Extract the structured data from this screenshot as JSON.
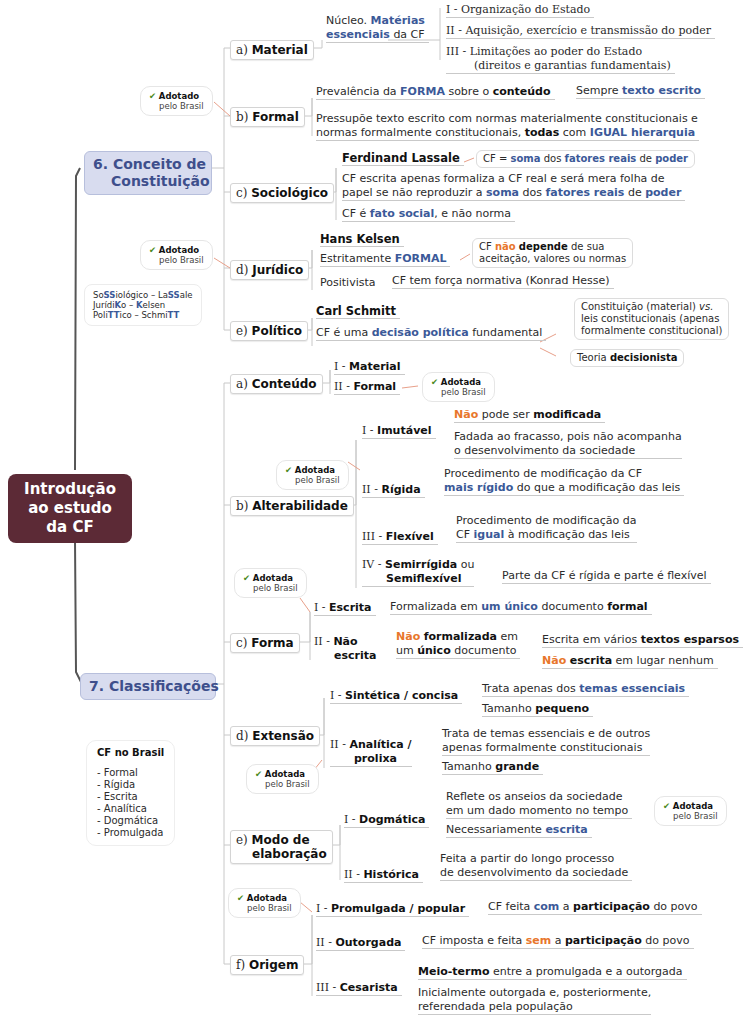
{
  "root": {
    "label_lines": [
      "Introdução",
      "ao estudo",
      "da CF"
    ]
  },
  "colors": {
    "root_bg": "#5c2a36",
    "topic_bg": "#d8dcef",
    "topic_text": "#3e4f8c",
    "emphasis_blue": "#3b5998",
    "emphasis_orange": "#e8762c",
    "check_green": "#4b8a22"
  },
  "topics": [
    {
      "id": "conceito",
      "label_lines": [
        "6. Conceito de",
        "Constituição"
      ]
    },
    {
      "id": "classificacoes",
      "label": "7. Classificações"
    }
  ],
  "adopted_note": {
    "check": "✔",
    "line1": "Adotado",
    "line2": "pelo Brasil"
  },
  "adopted_note_f": {
    "check": "✔",
    "line1": "Adotada",
    "line2": "pelo Brasil"
  },
  "conceito": {
    "material": {
      "label_prefix": "a) ",
      "label": "Material",
      "desc": [
        {
          "t": "Núcleo. "
        },
        {
          "t": "Matérias",
          "s": "bl"
        }
      ],
      "desc2": [
        {
          "t": "essenciais",
          "s": "bl"
        },
        {
          "t": " da CF"
        }
      ],
      "items": [
        "I - Organização do Estado",
        "II - Aquisição, exercício e transmissão do poder",
        "III - Limitações ao poder do Estado",
        "(direitos e garantias fundamentais)"
      ]
    },
    "formal": {
      "label_prefix": "b) ",
      "label": "Formal",
      "line1": [
        {
          "t": "Prevalência da "
        },
        {
          "t": "FORMA",
          "s": "bl"
        },
        {
          "t": " sobre o "
        },
        {
          "t": "conteúdo",
          "s": "b"
        }
      ],
      "line1_child": [
        {
          "t": "Sempre "
        },
        {
          "t": "texto escrito",
          "s": "bl"
        }
      ],
      "line2a": [
        {
          "t": "Pressupõe texto escrito com normas materialmente constitucionais e"
        }
      ],
      "line2b": [
        {
          "t": "normas formalmente constitucionais, "
        },
        {
          "t": "todas",
          "s": "b"
        },
        {
          "t": " com "
        },
        {
          "t": "IGUAL hierarquia",
          "s": "bl"
        }
      ]
    },
    "sociologico": {
      "label_prefix": "c) ",
      "label": "Sociológico",
      "author": "Ferdinand Lassale",
      "author_callout": [
        {
          "t": "CF = "
        },
        {
          "t": "soma",
          "s": "bl"
        },
        {
          "t": " dos "
        },
        {
          "t": "fatores reais",
          "s": "bl"
        },
        {
          "t": " de "
        },
        {
          "t": "poder",
          "s": "bl"
        }
      ],
      "line1a": [
        {
          "t": "CF escrita apenas formaliza a CF real e será mera folha de"
        }
      ],
      "line1b": [
        {
          "t": "papel se não reproduzir a "
        },
        {
          "t": "soma",
          "s": "bl"
        },
        {
          "t": " dos "
        },
        {
          "t": "fatores reais",
          "s": "bl"
        },
        {
          "t": " de "
        },
        {
          "t": "poder",
          "s": "bl"
        }
      ],
      "line2": [
        {
          "t": "CF é "
        },
        {
          "t": "fato social",
          "s": "bl"
        },
        {
          "t": ", e não norma"
        }
      ]
    },
    "juridico": {
      "label_prefix": "d) ",
      "label": "Jurídico",
      "author": "Hans Kelsen",
      "line1": [
        {
          "t": "Estritamente "
        },
        {
          "t": "FORMAL",
          "s": "bl"
        }
      ],
      "callout_a": [
        {
          "t": "CF "
        },
        {
          "t": "não",
          "s": "or"
        },
        {
          "t": " "
        },
        {
          "t": "depende",
          "s": "b"
        },
        {
          "t": " de sua"
        }
      ],
      "callout_b": [
        {
          "t": "aceitação, valores ou normas"
        }
      ],
      "line2": "Positivista",
      "line2_child": "CF tem força normativa (Konrad Hesse)"
    },
    "politico": {
      "label_prefix": "e) ",
      "label": "Político",
      "author": "Carl Schmitt",
      "line1": [
        {
          "t": "CF é uma "
        },
        {
          "t": "decisão política",
          "s": "bl"
        },
        {
          "t": " fundamental"
        }
      ],
      "callout1_a": [
        {
          "t": "Constituição (material) "
        },
        {
          "t": "vs.",
          "s": "it"
        }
      ],
      "callout1_b": [
        {
          "t": "leis constitucionais (apenas"
        }
      ],
      "callout1_c": [
        {
          "t": "formalmente constitucional)"
        }
      ],
      "callout2": [
        {
          "t": "Teoria "
        },
        {
          "t": "decisionista",
          "s": "b"
        }
      ]
    },
    "mnemonic": [
      [
        {
          "t": "So"
        },
        {
          "t": "SS",
          "s": "bl"
        },
        {
          "t": "iológico – La"
        },
        {
          "t": "SS",
          "s": "bl"
        },
        {
          "t": "ale"
        }
      ],
      [
        {
          "t": "Jurídi"
        },
        {
          "t": "K",
          "s": "bl"
        },
        {
          "t": "o – "
        },
        {
          "t": "K",
          "s": "bl"
        },
        {
          "t": "elsen"
        }
      ],
      [
        {
          "t": "Poli"
        },
        {
          "t": "TT",
          "s": "bl"
        },
        {
          "t": "ico – Schmi"
        },
        {
          "t": "TT",
          "s": "bl"
        }
      ]
    ]
  },
  "classificacoes": {
    "conteudo": {
      "label_prefix": "a) ",
      "label": "Conteúdo",
      "items": [
        {
          "num": "I - ",
          "label": "Material"
        },
        {
          "num": "II - ",
          "label": "Formal"
        }
      ]
    },
    "alterabilidade": {
      "label_prefix": "b) ",
      "label": "Alterabilidade",
      "items": [
        {
          "num": "I - ",
          "label": "Imutável",
          "desc1": [
            {
              "t": "Não",
              "s": "or"
            },
            {
              "t": " pode ser "
            },
            {
              "t": "modificada",
              "s": "b"
            }
          ],
          "desc2a": "Fadada ao fracasso, pois não acompanha",
          "desc2b": "o desenvolvimento da sociedade"
        },
        {
          "num": "II - ",
          "label": "Rígida",
          "desc_a": [
            {
              "t": "Procedimento de modificação da CF"
            }
          ],
          "desc_b": [
            {
              "t": "mais rígido",
              "s": "bl"
            },
            {
              "t": " do que a modificação das leis"
            }
          ]
        },
        {
          "num": "III - ",
          "label": "Flexível",
          "desc_a": [
            {
              "t": "Procedimento de modificação da"
            }
          ],
          "desc_b": [
            {
              "t": "CF "
            },
            {
              "t": "igual",
              "s": "bl"
            },
            {
              "t": " à modificação das leis"
            }
          ]
        },
        {
          "num": "IV - ",
          "label": "Semirrígida",
          "label_suffix": " ou",
          "label2": "Semiflexível",
          "desc": "Parte da CF é rígida e parte é flexível"
        }
      ]
    },
    "forma": {
      "label_prefix": "c) ",
      "label": "Forma",
      "items": [
        {
          "num": "I - ",
          "label": "Escrita",
          "desc": [
            {
              "t": "Formalizada em "
            },
            {
              "t": "um único",
              "s": "bl"
            },
            {
              "t": " documento "
            },
            {
              "t": "formal",
              "s": "b"
            }
          ]
        },
        {
          "num": "II - ",
          "label": "Não",
          "label2": "escrita",
          "desc_a": [
            {
              "t": "Não",
              "s": "or"
            },
            {
              "t": " "
            },
            {
              "t": "formalizada",
              "s": "b"
            },
            {
              "t": " em"
            }
          ],
          "desc_b": [
            {
              "t": "um "
            },
            {
              "t": "único",
              "s": "b"
            },
            {
              "t": " documento"
            }
          ],
          "child1": [
            {
              "t": "Escrita em vários "
            },
            {
              "t": "textos esparsos",
              "s": "b"
            }
          ],
          "child2": [
            {
              "t": "Não",
              "s": "or"
            },
            {
              "t": " "
            },
            {
              "t": "escrita",
              "s": "b"
            },
            {
              "t": " em lugar nenhum"
            }
          ]
        }
      ]
    },
    "extensao": {
      "label_prefix": "d) ",
      "label": "Extensão",
      "items": [
        {
          "num": "I - ",
          "label": "Sintética / concisa",
          "child1": [
            {
              "t": "Trata apenas dos "
            },
            {
              "t": "temas essenciais",
              "s": "bl"
            }
          ],
          "child2": [
            {
              "t": "Tamanho "
            },
            {
              "t": "pequeno",
              "s": "b"
            }
          ]
        },
        {
          "num": "II - ",
          "label": "Analítica /",
          "label2": "prolixa",
          "child1a": "Trata de temas essenciais e de outros",
          "child1b": "apenas formalmente constitucionais",
          "child2": [
            {
              "t": "Tamanho "
            },
            {
              "t": "grande",
              "s": "b"
            }
          ]
        }
      ]
    },
    "modo": {
      "label_prefix": "e) ",
      "label": "Modo de",
      "label2": "elaboração",
      "items": [
        {
          "num": "I - ",
          "label": "Dogmática",
          "child1a": "Reflete os anseios da sociedade",
          "child1b": "em um dado momento no tempo",
          "child2": [
            {
              "t": "Necessariamente "
            },
            {
              "t": "escrita",
              "s": "bl"
            }
          ]
        },
        {
          "num": "II - ",
          "label": "Histórica",
          "child_a": "Feita a partir do longo processo",
          "child_b": "de desenvolvimento da sociedade"
        }
      ]
    },
    "origem": {
      "label_prefix": "f) ",
      "label": "Origem",
      "items": [
        {
          "num": "I - ",
          "label": "Promulgada / popular",
          "desc": [
            {
              "t": "CF feita "
            },
            {
              "t": "com",
              "s": "bl"
            },
            {
              "t": " a "
            },
            {
              "t": "participação",
              "s": "b"
            },
            {
              "t": " do povo"
            }
          ]
        },
        {
          "num": "II - ",
          "label": "Outorgada",
          "desc": [
            {
              "t": "CF imposta e feita "
            },
            {
              "t": "sem",
              "s": "or"
            },
            {
              "t": " a "
            },
            {
              "t": "participação",
              "s": "b"
            },
            {
              "t": " do povo"
            }
          ]
        },
        {
          "num": "III - ",
          "label": "Cesarista",
          "child1": [
            {
              "t": "Meio-termo",
              "s": "b"
            },
            {
              "t": " entre a promulgada e a outorgada"
            }
          ],
          "child2a": "Inicialmente outorgada e, posteriormente,",
          "child2b": "referendada pela população"
        }
      ]
    },
    "cf_no_brasil": {
      "title": "CF no Brasil",
      "items": [
        "- Formal",
        "- Rígida",
        "- Escrita",
        "- Analítica",
        "- Dogmática",
        "- Promulgada"
      ]
    }
  }
}
